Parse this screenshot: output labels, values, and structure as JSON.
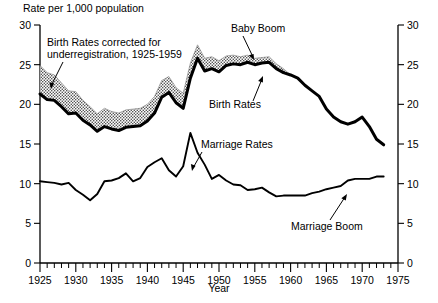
{
  "chart_data": {
    "type": "line",
    "title": "",
    "header_label": "Rate per 1,000 population",
    "xlabel": "Year",
    "ylabel": "",
    "xlim": [
      1925,
      1975
    ],
    "ylim": [
      0,
      30
    ],
    "grid": false,
    "legend_position": "inline-annotations",
    "x_ticks_major": [
      1925,
      1930,
      1935,
      1940,
      1945,
      1950,
      1955,
      1960,
      1965,
      1970,
      1975
    ],
    "x_tick_labels": [
      "1925",
      "1930",
      "1935",
      "1940",
      "1945",
      "1950",
      "1955",
      "1960",
      "1965",
      "1970",
      "1975"
    ],
    "x_tick_minor_step": 1,
    "y_ticks_left": [
      0,
      5,
      10,
      15,
      20,
      25,
      30
    ],
    "y_tick_labels_left": [
      "0",
      "5",
      "10",
      "15",
      "20",
      "25",
      "30"
    ],
    "y_ticks_right": [
      0,
      5,
      10,
      15,
      20,
      25,
      30
    ],
    "y_tick_labels_right": [
      "0",
      "5",
      "10",
      "15",
      "20",
      "25",
      "30"
    ],
    "x": [
      1925,
      1926,
      1927,
      1928,
      1929,
      1930,
      1931,
      1932,
      1933,
      1934,
      1935,
      1936,
      1937,
      1938,
      1939,
      1940,
      1941,
      1942,
      1943,
      1944,
      1945,
      1946,
      1947,
      1948,
      1949,
      1950,
      1951,
      1952,
      1953,
      1954,
      1955,
      1956,
      1957,
      1958,
      1959,
      1960,
      1961,
      1962,
      1963,
      1964,
      1965,
      1966,
      1967,
      1968,
      1969,
      1970,
      1971,
      1972,
      1973
    ],
    "series": [
      {
        "name": "Birth Rates",
        "style": "heavy-black-line",
        "values": [
          21.3,
          20.6,
          20.5,
          19.7,
          18.8,
          18.9,
          18.0,
          17.4,
          16.6,
          17.2,
          16.9,
          16.7,
          17.1,
          17.2,
          17.3,
          17.9,
          18.9,
          20.9,
          21.5,
          20.2,
          19.5,
          23.3,
          25.8,
          24.2,
          24.5,
          24.1,
          24.9,
          25.1,
          25.0,
          25.3,
          25.0,
          25.2,
          25.3,
          24.5,
          24.0,
          23.7,
          23.3,
          22.4,
          21.7,
          21.0,
          19.4,
          18.4,
          17.8,
          17.5,
          17.8,
          18.4,
          17.2,
          15.6,
          14.9
        ]
      },
      {
        "name": "Birth Rates corrected for underregistration",
        "style": "stippled-band-upper",
        "note": "Upper edge of stippled band, 1925-1959; merges with reported rate after 1959",
        "values": [
          24.9,
          24.0,
          23.7,
          22.7,
          21.7,
          21.6,
          20.5,
          19.7,
          18.8,
          19.5,
          19.1,
          18.9,
          19.3,
          19.4,
          19.5,
          20.0,
          21.0,
          23.0,
          23.5,
          22.1,
          21.4,
          25.2,
          27.5,
          25.8,
          26.0,
          25.5,
          26.1,
          26.2,
          26.0,
          26.2,
          25.8,
          25.9,
          26.0,
          25.1,
          24.5,
          23.7,
          23.3,
          22.4,
          21.7,
          21.0,
          19.4,
          18.4,
          17.8,
          17.5,
          17.8,
          18.4,
          17.2,
          15.6,
          14.9
        ]
      },
      {
        "name": "Marriage Rates",
        "style": "thin-black-line",
        "values": [
          10.3,
          10.2,
          10.1,
          9.9,
          10.1,
          9.2,
          8.6,
          7.9,
          8.7,
          10.3,
          10.4,
          10.7,
          11.3,
          10.3,
          10.7,
          12.1,
          12.7,
          13.2,
          11.7,
          10.9,
          12.2,
          16.4,
          13.9,
          12.4,
          10.6,
          11.1,
          10.4,
          9.9,
          9.8,
          9.2,
          9.3,
          9.5,
          8.9,
          8.4,
          8.5,
          8.5,
          8.5,
          8.5,
          8.8,
          9.0,
          9.3,
          9.5,
          9.7,
          10.4,
          10.6,
          10.6,
          10.6,
          10.9,
          10.9
        ]
      }
    ],
    "annotations": [
      {
        "id": "birth-corrected",
        "text_line1": "Birth Rates corrected for",
        "text_line2": "underregistration, 1925-1959",
        "points_to": "stippled band"
      },
      {
        "id": "baby-boom",
        "text": "Baby Boom",
        "points_to": "birth rate plateau 1950s"
      },
      {
        "id": "birth-rates",
        "text": "Birth Rates",
        "points_to": "birth rate line circa 1958"
      },
      {
        "id": "marriage-rates",
        "text": "Marriage Rates",
        "points_to": "marriage rate line circa 1948"
      },
      {
        "id": "marriage-boom",
        "text": "Marriage Boom",
        "points_to": "marriage rate rise circa 1968"
      }
    ]
  }
}
